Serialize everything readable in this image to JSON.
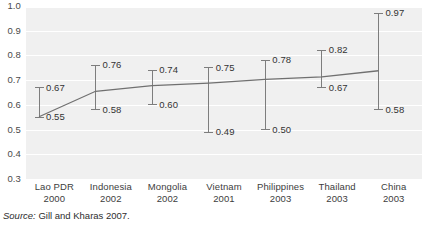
{
  "chart_data": {
    "type": "line",
    "title": "",
    "subtitle": "",
    "xlabel": "",
    "ylabel": "",
    "ylim": [
      0.3,
      1.0
    ],
    "ytick_labels": [
      "1.0",
      "0.9",
      "0.8",
      "0.7",
      "0.6",
      "0.5",
      "0.4",
      "0.3"
    ],
    "ytick_values": [
      1.0,
      0.9,
      0.8,
      0.7,
      0.6,
      0.5,
      0.4,
      0.3
    ],
    "grid": true,
    "legend": "none",
    "categories": [
      "Lao PDR",
      "Indonesia",
      "Mongolia",
      "Vietnam",
      "Philippines",
      "Thailand",
      "China"
    ],
    "years": [
      "2000",
      "2002",
      "2002",
      "2001",
      "2003",
      "2003",
      "2003"
    ],
    "series": [
      {
        "name": "Upper bound",
        "values": [
          0.67,
          0.76,
          0.74,
          0.75,
          0.78,
          0.82,
          0.97
        ],
        "labels": [
          "0.67",
          "0.76",
          "0.74",
          "0.75",
          "0.78",
          "0.82",
          "0.97"
        ]
      },
      {
        "name": "Lower bound",
        "values": [
          0.55,
          0.58,
          0.6,
          0.49,
          0.5,
          0.67,
          0.58
        ],
        "labels": [
          "0.55",
          "0.58",
          "0.60",
          "0.49",
          "0.50",
          "0.67",
          "0.58"
        ]
      },
      {
        "name": "Trend line",
        "values": [
          0.552,
          0.655,
          0.678,
          0.688,
          0.703,
          0.713,
          0.738
        ]
      }
    ],
    "colors": {
      "plot_background": "#f0f0f0",
      "gridline": "#ffffff",
      "errorbar": "#7d7d7d",
      "trendline": "#707070",
      "text": "#333333"
    }
  },
  "source": {
    "label": "Source:",
    "text": "Gill and Kharas 2007."
  }
}
